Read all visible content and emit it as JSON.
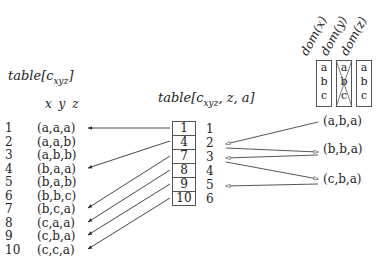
{
  "left_table": {
    "title": "table[c",
    "title_sub": "xyz",
    "title_end": "]",
    "columns_label": "x y z",
    "rows": [
      {
        "index": "1",
        "value": "(a,a,a)"
      },
      {
        "index": "2",
        "value": "(a,a,b)"
      },
      {
        "index": "3",
        "value": "(a,b,b)"
      },
      {
        "index": "4",
        "value": "(b,a,a)"
      },
      {
        "index": "5",
        "value": "(b,a,b)"
      },
      {
        "index": "6",
        "value": "(b,b,c)"
      },
      {
        "index": "7",
        "value": "(b,c,a)"
      },
      {
        "index": "8",
        "value": "(c,a,a)"
      },
      {
        "index": "9",
        "value": "(c,b,a)"
      },
      {
        "index": "10",
        "value": "(c,c,a)"
      }
    ]
  },
  "middle_table": {
    "title": "table[c",
    "title_sub": "xyz",
    "title_end": ", z, a]",
    "cells": [
      "1",
      "4",
      "7",
      "8",
      "9",
      "10"
    ],
    "indices": [
      "1",
      "2",
      "3",
      "4",
      "5",
      "6"
    ]
  },
  "domains": [
    {
      "label": "dom(x)",
      "values": [
        "a",
        "b",
        "c"
      ],
      "crossed": false
    },
    {
      "label": "dom(y)",
      "values": [
        "a",
        "b",
        "c"
      ],
      "crossed": true
    },
    {
      "label": "dom(z)",
      "values": [
        "a",
        "b",
        "c"
      ],
      "crossed": false
    }
  ],
  "tuples": [
    "(a,b,a)",
    "(b,b,a)",
    "(c,b,a)"
  ],
  "edges": {
    "middle_to_left": [
      [
        1,
        1
      ],
      [
        4,
        4
      ],
      [
        7,
        7
      ],
      [
        8,
        8
      ],
      [
        9,
        9
      ],
      [
        10,
        10
      ]
    ],
    "right": [
      {
        "from": "(a,b,a)",
        "to": "2"
      },
      {
        "from": "2",
        "to": "(b,b,a)"
      },
      {
        "from": "(b,b,a)",
        "to": "3"
      },
      {
        "from": "3",
        "to": "(c,b,a)"
      },
      {
        "from": "(c,b,a)",
        "to": "5"
      }
    ]
  }
}
